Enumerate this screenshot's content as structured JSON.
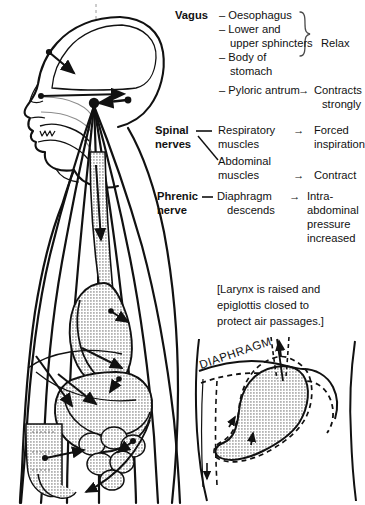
{
  "figure": {
    "title_hidden": "",
    "colors": {
      "ink": "#111111",
      "organ_fill": "#d2d2d2",
      "background": "#ffffff"
    }
  },
  "legend": {
    "rows": [
      {
        "nerve": "Vagus",
        "targets": [
          "Oesophagus",
          "Lower and",
          "upper sphincters",
          "Body of",
          "stomach"
        ],
        "brace": true,
        "effect": "Relax"
      },
      {
        "nerve": "",
        "targets": [
          "Pyloric antrum"
        ],
        "arrow": "→",
        "effect": [
          "Contracts",
          "strongly"
        ]
      },
      {
        "nerve": "Spinal",
        "nerve2": "nerves",
        "targets": [
          "Respiratory",
          "muscles"
        ],
        "arrow": "→",
        "effect": [
          "Forced",
          "inspiration"
        ]
      },
      {
        "nerve": "",
        "targets": [
          "Abdominal",
          "muscles"
        ],
        "arrow": "→",
        "effect": [
          "Contract"
        ]
      },
      {
        "nerve": "Phrenic",
        "nerve2": "nerve",
        "dash": "—",
        "targets": [
          "Diaphragm",
          "descends"
        ],
        "arrow": "→",
        "effect": [
          "Intra-",
          "abdominal",
          "pressure",
          "increased"
        ]
      }
    ],
    "vagus_label": "Vagus",
    "vagus_items": {
      "dash": "–",
      "l1": "Oesophagus",
      "l2": "Lower and",
      "l3": "upper sphincters",
      "l4": "Body of",
      "l5": "stomach",
      "l6": "Pyloric antrum"
    },
    "relax_label": "Relax",
    "contracts_l1": "Contracts",
    "contracts_l2": "strongly",
    "spinal_label_l1": "Spinal",
    "spinal_label_l2": "nerves",
    "respiratory_l1": "Respiratory",
    "respiratory_l2": "muscles",
    "abdominal_l1": "Abdominal",
    "abdominal_l2": "muscles",
    "forced_l1": "Forced",
    "forced_l2": "inspiration",
    "contract_label": "Contract",
    "phrenic_label_l1": "Phrenic",
    "phrenic_label_l2": "nerve",
    "diaphragm_l1": "Diaphragm",
    "diaphragm_l2": "descends",
    "intra_l1": "Intra-",
    "intra_l2": "abdominal",
    "intra_l3": "pressure",
    "intra_l4": "increased",
    "arrow_glyph": "→",
    "dash_glyph": "–",
    "emdash_glyph": "—"
  },
  "note": {
    "line1": "[Larynx is raised and",
    "line2": "epiglottis closed to",
    "line3": "protect air passages.]"
  },
  "inset": {
    "label": "DIAPHRAGM"
  },
  "body_figure": {
    "parts": [
      "head-profile",
      "brain",
      "vomiting-center",
      "nerve-fibres",
      "oesophagus",
      "stomach",
      "duodenum",
      "small-intestine",
      "torso-outline",
      "abdominal-wall-lines"
    ]
  }
}
